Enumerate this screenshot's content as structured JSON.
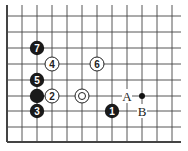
{
  "diagram": {
    "type": "go-board-fragment",
    "grid": {
      "columns_x": [
        7,
        22,
        37,
        52,
        67,
        82,
        97,
        112,
        127,
        142,
        157,
        172
      ],
      "rows_y": [
        16,
        32,
        48,
        64,
        80,
        96,
        111,
        127,
        142
      ],
      "edges": [
        "left",
        "bottom"
      ],
      "line_color": "#444444"
    },
    "stones": [
      {
        "color": "black",
        "col": 2,
        "row": 2,
        "label": "7"
      },
      {
        "color": "white",
        "col": 3,
        "row": 3,
        "label": "4"
      },
      {
        "color": "white",
        "col": 6,
        "row": 3,
        "label": "6"
      },
      {
        "color": "black",
        "col": 2,
        "row": 4,
        "label": "5"
      },
      {
        "color": "black",
        "col": 2,
        "row": 5,
        "label": ""
      },
      {
        "color": "white",
        "col": 3,
        "row": 5,
        "label": "2"
      },
      {
        "color": "white",
        "col": 5,
        "row": 5,
        "label": "",
        "marked": true
      },
      {
        "color": "black",
        "col": 2,
        "row": 6,
        "label": "3"
      },
      {
        "color": "black",
        "col": 7,
        "row": 6,
        "label": "1"
      }
    ],
    "points": [
      {
        "col": 8,
        "row": 5,
        "label": "A"
      },
      {
        "col": 9,
        "row": 6,
        "label": "B"
      }
    ],
    "markers": [
      {
        "col": 9,
        "row": 5,
        "type": "small-black-dot"
      }
    ]
  }
}
